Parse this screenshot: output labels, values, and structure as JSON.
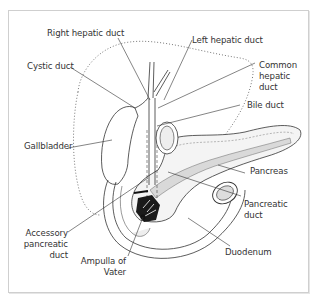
{
  "figure": {
    "type": "anatomical-diagram"
  },
  "labels": {
    "right_hepatic_duct": "Right hepatic duct",
    "left_hepatic_duct": "Left hepatic duct",
    "cystic_duct": "Cystic duct",
    "common_hepatic_duct": "Common\nhepatic\nduct",
    "bile_duct": "Bile duct",
    "gallbladder": "Gallbladder",
    "pancreas": "Pancreas",
    "pancreatic_duct": "Pancreatic\nduct",
    "accessory_pancreatic_duct": "Accessory\npancreatic\nduct",
    "ampulla_of_vater": "Ampulla of\nVater",
    "duodenum": "Duodenum"
  },
  "colors": {
    "line": "#333333",
    "frame": "#cfcfcf",
    "pancreas_fill": "#f4f4f4",
    "pancreatic_duct_fill": "#d9d9d9",
    "dark_fill": "#1a1a1a"
  }
}
